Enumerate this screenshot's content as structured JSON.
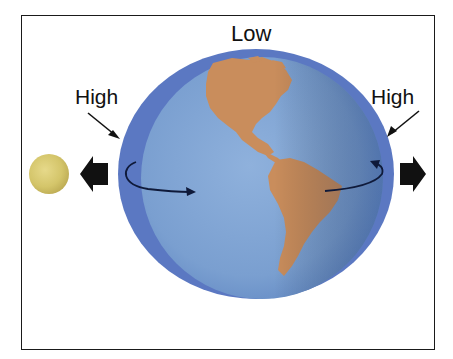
{
  "diagram": {
    "labels": {
      "top": "Low",
      "left": "High",
      "right": "High"
    },
    "elements": {
      "moon": "moon",
      "earth": "earth",
      "water_envelope": "tidal-bulge-ocean",
      "left_force_arrow": "arrow-toward-moon",
      "right_force_arrow": "arrow-away-from-moon",
      "rotation_arrows": "earth-rotation"
    },
    "colors": {
      "ocean_envelope": "#5b78c2",
      "earth_ocean": "#7ea3d3",
      "land": "#c98d5c",
      "moon": "#d8cb6e",
      "arrow": "#111111",
      "frame": "#1a1a1a"
    }
  }
}
